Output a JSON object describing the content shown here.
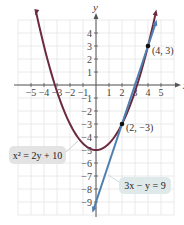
{
  "chart_data": {
    "type": "line",
    "title": "",
    "xlabel": "x",
    "ylabel": "y",
    "xlim": [
      -6,
      6
    ],
    "ylim": [
      -10,
      5
    ],
    "grid": true,
    "x_ticks": [
      -5,
      -4,
      -3,
      -2,
      -1,
      1,
      2,
      3,
      4,
      5
    ],
    "x_tick_labels": [
      "−5",
      "−4",
      "−3",
      "−2",
      "−1",
      "1",
      "2",
      "3",
      "4",
      "5"
    ],
    "y_ticks": [
      4,
      3,
      2,
      1,
      -1,
      -2,
      -3,
      -4,
      -5,
      -6,
      -7,
      -8,
      -9
    ],
    "y_tick_labels": [
      "4",
      "3",
      "2",
      "1",
      "−1",
      "−2",
      "−3",
      "−4",
      "−5",
      "−6",
      "−7",
      "−8",
      "−9"
    ],
    "series": [
      {
        "name": "x^2 = 2y + 10",
        "kind": "parabola",
        "equation": "y = x^2/2 - 5",
        "color": "#6b2a3f",
        "x_range": [
          -4.6,
          4.6
        ],
        "vertex": [
          0,
          -5
        ]
      },
      {
        "name": "3x − y = 9",
        "kind": "line",
        "equation": "y = 3x - 9",
        "color": "#4f7fb0",
        "x_range": [
          -0.2,
          4.6
        ]
      }
    ],
    "points": [
      {
        "label": "(4, 3)",
        "x": 4,
        "y": 3
      },
      {
        "label": "(2, −3)",
        "x": 2,
        "y": -3
      }
    ],
    "annotations": [
      {
        "text": "x² = 2y + 10",
        "target": "parabola"
      },
      {
        "text": "3x − y = 9",
        "target": "line"
      }
    ]
  },
  "labels": {
    "x_axis": "x",
    "y_axis": "y",
    "point_a": "(4, 3)",
    "point_b": "(2, −3)",
    "eq_parabola": "x² = 2y + 10",
    "eq_line": "3x − y = 9"
  }
}
